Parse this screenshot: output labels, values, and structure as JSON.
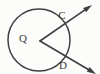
{
  "figure": {
    "background_color": "#fdfdfb",
    "stroke_color": "#2b2b2b",
    "labels": {
      "center": "Q",
      "upper_point": "C",
      "lower_point": "D"
    },
    "geometry": {
      "circle": {
        "center_x": 39,
        "center_y": 40,
        "radius": 31
      },
      "vertex": {
        "x": 40,
        "y": 41
      },
      "upper_ray": {
        "from_x": 40,
        "from_y": 41,
        "to_x": 92,
        "to_y": 5,
        "intersection_x": 61,
        "intersection_y": 26,
        "has_arrowhead": true
      },
      "lower_ray": {
        "from_x": 40,
        "from_y": 41,
        "to_x": 96,
        "to_y": 74,
        "intersection_x": 60,
        "intersection_y": 56,
        "has_arrowhead": true
      }
    },
    "label_positions": {
      "center": {
        "x": 23,
        "y": 42
      },
      "upper_point": {
        "x": 62,
        "y": 19
      },
      "lower_point": {
        "x": 63,
        "y": 69
      }
    }
  }
}
